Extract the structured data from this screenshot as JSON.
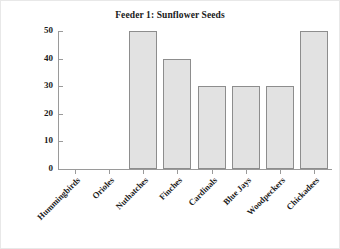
{
  "chart_data": {
    "type": "bar",
    "title": "Feeder 1: Sunflower Seeds",
    "xlabel": "",
    "ylabel": "",
    "categories": [
      "Hummingbirds",
      "Orioles",
      "Nuthatches",
      "Finches",
      "Cardinals",
      "Blue Jays",
      "Woodpeckers",
      "Chickadees"
    ],
    "values": [
      0,
      0,
      50,
      40,
      30,
      30,
      30,
      50
    ],
    "ylim": [
      0,
      50
    ],
    "yticks": [
      0,
      10,
      20,
      30,
      40,
      50
    ],
    "ytick_labels": [
      "0",
      "10",
      "20",
      "30",
      "40",
      "50"
    ],
    "grid": false,
    "legend": null,
    "bar_fill_color": "#e2e2e2",
    "bar_border_color": "#8d8d8d",
    "axis_color": "#9a9a9a",
    "text_color": "#1a1a1a",
    "background_color": "#ffffff",
    "xtick_label_rotation": -45
  }
}
